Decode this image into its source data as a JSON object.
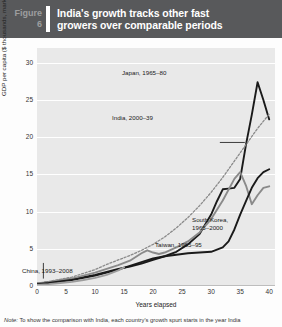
{
  "header": {
    "figure_word": "Figure",
    "figure_number": "6",
    "title_line1": "India's growth tracks other fast",
    "title_line2": "growers over comparable periods"
  },
  "note": {
    "prefix": "Note:",
    "text": "To show the comparison with India, each country's growth spurt starts in the year India"
  },
  "annotations": {
    "japan": "Japan, 1965–80",
    "india": "India, 2000–39",
    "korea_l1": "South Korea,",
    "korea_l2": "1965–2000",
    "taiwan": "Taiwan, 1965–95",
    "china": "China, 1993–2008"
  },
  "colors": {
    "header_bg": "#58595b",
    "plot_bg": "#e9e9e9",
    "gridline": "#ffffff",
    "dark_line": "#1a1a1a",
    "gray_line": "#8a8a8a",
    "dotted_line": "#8a8a8a"
  },
  "chart_data": {
    "type": "line",
    "title": "India's growth tracks other fast growers over comparable periods",
    "xlabel": "Years elapsed",
    "ylabel": "GDP per capita ($ thousands, market exchange rates)",
    "xlim": [
      0,
      41
    ],
    "ylim": [
      0,
      32
    ],
    "xticks": [
      0,
      5,
      10,
      15,
      20,
      25,
      30,
      35,
      40
    ],
    "yticks": [
      0,
      5,
      10,
      15,
      20,
      25,
      30
    ],
    "grid": "horizontal",
    "legend": "inline-annotations",
    "series": [
      {
        "name": "Japan, 1965–80",
        "style": "solid",
        "color": "#1a1a1a",
        "x": [
          0,
          2,
          4,
          6,
          8,
          10,
          12,
          14,
          16,
          18,
          20,
          22,
          24,
          26,
          28,
          30,
          31,
          32,
          33,
          34,
          35,
          36,
          37,
          38,
          39,
          40
        ],
        "y": [
          0.3,
          0.5,
          0.7,
          0.9,
          1.2,
          1.5,
          1.9,
          2.3,
          2.6,
          3.0,
          3.5,
          4.0,
          4.6,
          5.6,
          7.0,
          9.6,
          11.4,
          13.0,
          13.1,
          13.2,
          14.4,
          19.0,
          23.0,
          27.4,
          25.0,
          22.4
        ]
      },
      {
        "name": "India, 2000–39",
        "style": "dotted",
        "color": "#8a8a8a",
        "x": [
          0,
          2,
          4,
          6,
          8,
          10,
          12,
          14,
          16,
          18,
          20,
          22,
          24,
          26,
          28,
          30,
          32,
          34,
          36,
          38,
          40
        ],
        "y": [
          0.4,
          0.6,
          0.9,
          1.2,
          1.7,
          2.2,
          2.9,
          3.5,
          4.1,
          4.8,
          5.6,
          6.6,
          7.8,
          9.2,
          10.8,
          12.6,
          14.6,
          16.8,
          19.0,
          21.2,
          23.1
        ]
      },
      {
        "name": "South Korea, 1965–2000",
        "style": "solid",
        "color": "#8a8a8a",
        "x": [
          0,
          2,
          4,
          6,
          8,
          10,
          12,
          14,
          16,
          18,
          19,
          20,
          21,
          22,
          24,
          26,
          28,
          30,
          32,
          34,
          35,
          36,
          37,
          38,
          39,
          40
        ],
        "y": [
          0.3,
          0.5,
          0.8,
          1.0,
          1.4,
          1.8,
          2.3,
          2.8,
          3.4,
          4.4,
          4.8,
          4.5,
          4.3,
          4.5,
          5.2,
          6.0,
          7.2,
          9.0,
          11.5,
          14.4,
          15.3,
          13.5,
          11.0,
          12.2,
          13.2,
          13.4
        ]
      },
      {
        "name": "Taiwan, 1965–95",
        "style": "solid",
        "color": "#1a1a1a",
        "x": [
          0,
          2,
          4,
          6,
          8,
          10,
          12,
          14,
          16,
          18,
          20,
          22,
          24,
          26,
          28,
          30,
          32,
          33,
          34,
          35,
          36,
          37,
          38,
          39,
          40
        ],
        "y": [
          0.25,
          0.4,
          0.6,
          0.8,
          1.1,
          1.4,
          1.8,
          2.2,
          2.7,
          3.2,
          3.7,
          4.0,
          4.2,
          4.4,
          4.5,
          4.6,
          5.2,
          6.0,
          7.6,
          9.6,
          11.4,
          13.2,
          14.5,
          15.3,
          15.7
        ]
      },
      {
        "name": "China, 1993–2008",
        "style": "solid",
        "color": "#9c9c9c",
        "x": [
          0,
          2,
          4,
          6,
          8,
          10,
          12,
          14,
          15
        ],
        "y": [
          0.15,
          0.25,
          0.4,
          0.55,
          0.8,
          1.1,
          1.5,
          2.1,
          2.5
        ]
      }
    ]
  }
}
